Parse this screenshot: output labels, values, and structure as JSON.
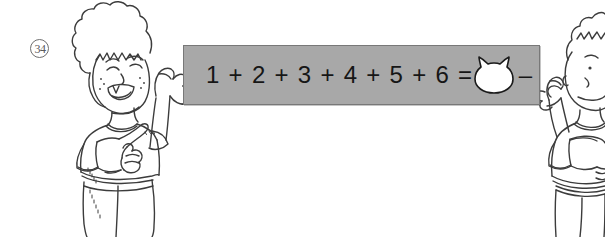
{
  "page": {
    "background_color": "#ffffff",
    "width": 605,
    "height": 237
  },
  "exercise": {
    "item_number": "34",
    "item_number_style": "circled"
  },
  "banner": {
    "fill_color": "#a8a8a8",
    "border_color": "#787878",
    "equation_text": "1 + 2 + 3 + 4 + 5 + 6 = 22 –",
    "text_color": "#161616",
    "answer_placeholder": {
      "icon_name": "cat-head-icon",
      "fill_color": "#ffffff",
      "outline_color": "#1a1a1a",
      "value": ""
    }
  },
  "illustration": {
    "line_color": "#3c3c3c",
    "characters": [
      {
        "name": "left-child",
        "description": "Smiling child with curly afro hair, freckles, open mouth with one tooth, short-sleeve t-shirt, right arm raised holding the left edge of the banner, left hand pointing upward."
      },
      {
        "name": "right-child",
        "description": "Child with short spiky hair, partially cropped at the right edge of the image, arm raised holding the right edge of the banner, wearing a short-sleeve t-shirt."
      }
    ]
  }
}
